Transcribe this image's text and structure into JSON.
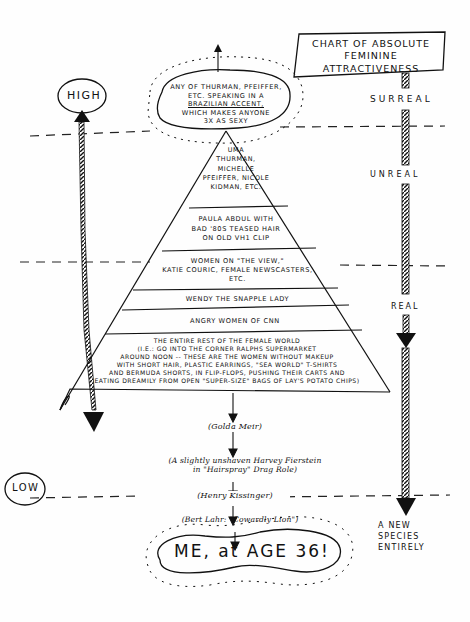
{
  "title": {
    "line1": "Chart of Absolute",
    "line2": "Feminine Attractiveness"
  },
  "scale_left": {
    "top_label": "High",
    "bottom_label": "Low"
  },
  "scale_right": {
    "zones": [
      "Surreal",
      "Unreal",
      "Real"
    ],
    "bottom_label_line1": "A new",
    "bottom_label_line2": "species",
    "bottom_label_line3": "entirely"
  },
  "top_bubble": {
    "line1": "Any of Thurman, Pfeiffer,",
    "line2": "etc. speaking in a",
    "line3": "Brazilian accent,",
    "line4": "which makes anyone",
    "line5": "3x as sexy"
  },
  "pyramid": {
    "tiers": [
      {
        "lines": [
          "Uma",
          "Thurman,",
          "Michelle",
          "Pfeiffer, Nicole",
          "Kidman, etc."
        ]
      },
      {
        "lines": [
          "Paula Abdul with",
          "bad '80s teased hair",
          "on old VH1 clip"
        ]
      },
      {
        "lines": [
          "Women on \"The View,\"",
          "Katie Couric, female newscasters,",
          "etc."
        ]
      },
      {
        "lines": [
          "Wendy the Snapple Lady"
        ]
      },
      {
        "lines": [
          "Angry women of CNN"
        ]
      },
      {
        "lines": [
          "The entire rest of the female world",
          "(i.e.: Go into the corner Ralphs supermarket",
          "around noon -- these are the women without makeup",
          "with short hair, plastic earrings, \"Sea World\" T-shirts",
          "and Bermuda shorts, in flip-flops, pushing their carts and",
          "eating dreamily from open \"super-size\" bags of Lay's potato chips)"
        ]
      }
    ]
  },
  "below_pyramid": [
    {
      "text": "(Golda Meir)"
    },
    {
      "line1": "(A slightly unshaven Harvey Fierstein",
      "line2": "in \"Hairspray\" Drag Role)"
    },
    {
      "text": "(Henry Kissinger)"
    },
    {
      "text": "(Bert Lahr: \"Cowardly Lion\")"
    }
  ],
  "bottom_bubble": {
    "text": "ME, at AGE 36!"
  },
  "colors": {
    "ink": "#111111",
    "paper": "#fefefe"
  }
}
